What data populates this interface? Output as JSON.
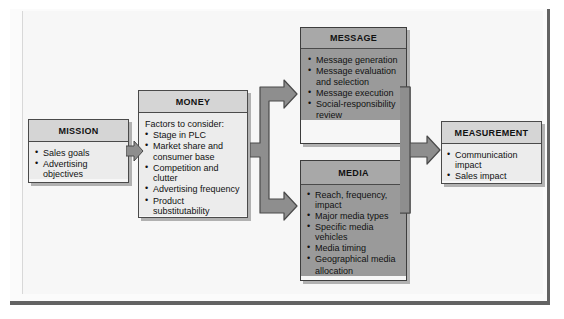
{
  "diagram": {
    "colors": {
      "frame_border": "#636363",
      "light_header": "#d5d5d5",
      "light_body": "#ececec",
      "dark_header": "#a8a8a8",
      "dark_body": "#9a9a9a",
      "arrow_fill": "#8e8e8e",
      "arrow_stroke": "#4a4a4a",
      "text": "#111111"
    },
    "boxes": [
      {
        "id": "mission",
        "title": "MISSION",
        "style": "light",
        "items": [
          {
            "text": "Sales goals",
            "bullet": true
          },
          {
            "text": "Advertising objectives",
            "bullet": true
          }
        ]
      },
      {
        "id": "money",
        "title": "MONEY",
        "style": "light",
        "lead": "Factors to consider:",
        "items": [
          {
            "text": "Stage in PLC",
            "bullet": true
          },
          {
            "text": "Market share and",
            "bullet": true
          },
          {
            "text": "consumer base",
            "bullet": false
          },
          {
            "text": "Competition and clutter",
            "bullet": true
          },
          {
            "text": "Advertising frequency",
            "bullet": true
          },
          {
            "text": "Product substitutability",
            "bullet": true
          }
        ]
      },
      {
        "id": "message",
        "title": "MESSAGE",
        "style": "dark",
        "items": [
          {
            "text": "Message generation",
            "bullet": true
          },
          {
            "text": "Message evaluation",
            "bullet": true
          },
          {
            "text": "and selection",
            "bullet": false
          },
          {
            "text": "Message execution",
            "bullet": true
          },
          {
            "text": "Social-responsibility",
            "bullet": true
          },
          {
            "text": "review",
            "bullet": false
          }
        ]
      },
      {
        "id": "media",
        "title": "MEDIA",
        "style": "dark",
        "items": [
          {
            "text": "Reach, frequency, impact",
            "bullet": true
          },
          {
            "text": "Major media types",
            "bullet": true
          },
          {
            "text": "Specific media vehicles",
            "bullet": true
          },
          {
            "text": "Media timing",
            "bullet": true
          },
          {
            "text": "Geographical media",
            "bullet": true
          },
          {
            "text": "allocation",
            "bullet": false
          }
        ]
      },
      {
        "id": "measurement",
        "title": "MEASUREMENT",
        "style": "light",
        "items": [
          {
            "text": "Communication impact",
            "bullet": true
          },
          {
            "text": "Sales impact",
            "bullet": true
          }
        ]
      }
    ],
    "connectors": [
      {
        "id": "mission-money",
        "type": "arrow-right",
        "from": "mission",
        "to": "money"
      },
      {
        "id": "money-split",
        "type": "fork-right",
        "from": "money",
        "to": "message, media"
      },
      {
        "id": "merge-measurement",
        "type": "merge-right",
        "from": "message, media",
        "to": "measurement"
      }
    ]
  }
}
